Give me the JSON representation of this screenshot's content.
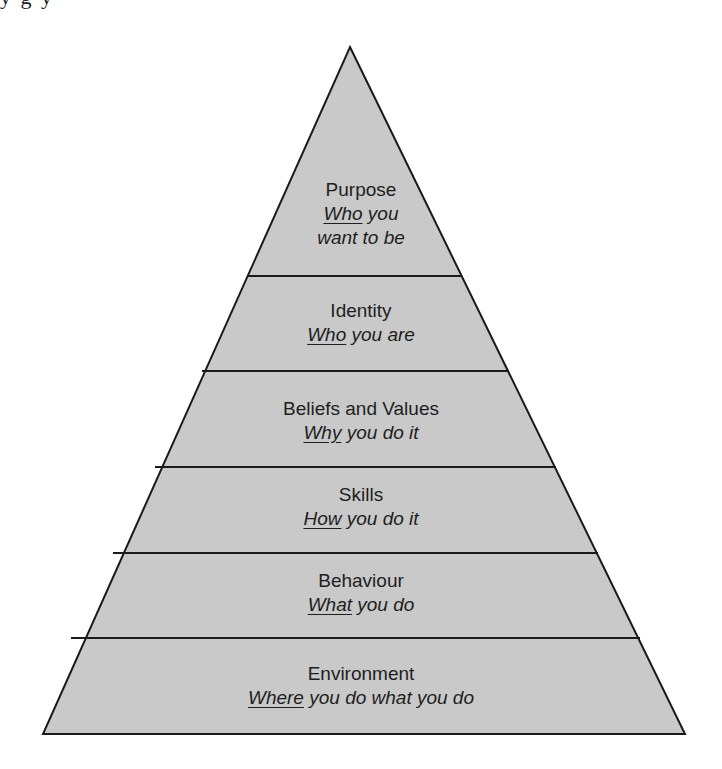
{
  "cropped_header_text": "y    g    y",
  "diagram": {
    "type": "pyramid",
    "fill_color": "#c9c9c9",
    "stroke_color": "#1a1a1a",
    "layers": [
      {
        "title": "Purpose",
        "sub_emph": "Who",
        "sub_rest": " you",
        "sub_line2": "want to be"
      },
      {
        "title": "Identity",
        "sub_emph": "Who",
        "sub_rest": " you are",
        "sub_line2": ""
      },
      {
        "title": "Beliefs and Values",
        "sub_emph": "Why",
        "sub_rest": " you do it",
        "sub_line2": ""
      },
      {
        "title": "Skills",
        "sub_emph": "How",
        "sub_rest": " you do it",
        "sub_line2": ""
      },
      {
        "title": "Behaviour",
        "sub_emph": "What",
        "sub_rest": " you do",
        "sub_line2": ""
      },
      {
        "title": "Environment",
        "sub_emph": "Where",
        "sub_rest": " you do what you do",
        "sub_line2": ""
      }
    ]
  }
}
